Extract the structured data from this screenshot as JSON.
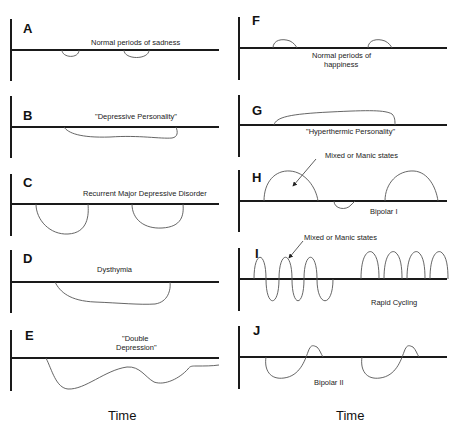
{
  "figure": {
    "left_column": {
      "x_axis_label": "Time",
      "panels": [
        {
          "letter": "A",
          "label": "Normal periods of sadness"
        },
        {
          "letter": "B",
          "label": "\"Depressive Personality\""
        },
        {
          "letter": "C",
          "label": "Recurrent Major Depressive Disorder"
        },
        {
          "letter": "D",
          "label": "Dysthymia"
        },
        {
          "letter": "E",
          "label_line1": "\"Double",
          "label_line2": "Depression\""
        }
      ]
    },
    "right_column": {
      "x_axis_label": "Time",
      "panels": [
        {
          "letter": "F",
          "label_line1": "Normal periods of",
          "label_line2": "happiness"
        },
        {
          "letter": "G",
          "label": "\"Hyperthermic Personality\""
        },
        {
          "letter": "H",
          "label": "Bipolar I",
          "annotation": "Mixed or Manic states"
        },
        {
          "letter": "I",
          "label": "Rapid Cycling",
          "annotation": "Mixed or Manic states"
        },
        {
          "letter": "J",
          "label": "Bipolar II"
        }
      ]
    }
  }
}
